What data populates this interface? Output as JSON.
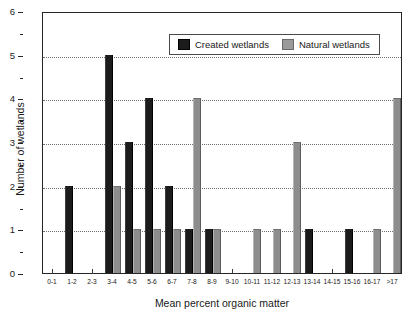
{
  "chart_data": {
    "type": "bar",
    "title": "",
    "xlabel": "Mean percent organic matter",
    "ylabel": "Number of wetlands",
    "ylim": [
      0,
      6
    ],
    "ytick_labels": [
      "0",
      "1",
      "2",
      "3",
      "4",
      "5",
      "6"
    ],
    "grid": "horizontal dotted gridlines at y = 1,2,3,4,5",
    "legend_position": "top-center inside plot",
    "categories": [
      "0-1",
      "1-2",
      "2-3",
      "3-4",
      "4-5",
      "5-6",
      "6-7",
      "7-8",
      "8-9",
      "9-10",
      "10-11",
      "11-12",
      "12-13",
      "13-14",
      "14-15",
      "15-16",
      "16-17",
      ">17"
    ],
    "series": [
      {
        "name": "Created wetlands",
        "color": "#1c1c1c",
        "values": [
          0,
          2,
          0,
          5,
          3,
          4,
          2,
          1,
          1,
          0,
          0,
          0,
          0,
          1,
          0,
          1,
          0,
          0
        ]
      },
      {
        "name": "Natural wetlands",
        "color": "#8d8d8d",
        "values": [
          0,
          0,
          0,
          2,
          1,
          1,
          1,
          4,
          1,
          0,
          1,
          1,
          3,
          0,
          0,
          0,
          1,
          4
        ]
      }
    ]
  },
  "legend": {
    "items": [
      {
        "label": "Created wetlands",
        "swatch": "created-swatch"
      },
      {
        "label": "Natural wetlands",
        "swatch": "natural-swatch"
      }
    ]
  },
  "axes": {
    "y_title": "Number of wetlands",
    "x_title": "Mean percent organic matter"
  }
}
